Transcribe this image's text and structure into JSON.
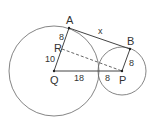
{
  "diagram": {
    "colors": {
      "stroke": "#555555",
      "text": "#333333",
      "background": "#ffffff"
    },
    "circles": [
      {
        "name": "large-circle",
        "center": "Q",
        "cx": 54,
        "cy": 71,
        "r": 45
      },
      {
        "name": "small-circle",
        "center": "P",
        "cx": 122,
        "cy": 71,
        "r": 24
      }
    ],
    "points": {
      "A": {
        "label": "A",
        "x": 69,
        "y": 28
      },
      "B": {
        "label": "B",
        "x": 130,
        "y": 49
      },
      "R": {
        "label": "R",
        "x": 62,
        "y": 49
      },
      "Q": {
        "label": "Q",
        "x": 54,
        "y": 71
      },
      "P": {
        "label": "P",
        "x": 122,
        "y": 71
      }
    },
    "segment_labels": {
      "AR": "8",
      "RQ": "10",
      "QP_left": "18",
      "QP_right": "8",
      "BP": "8",
      "AB": "x"
    }
  }
}
